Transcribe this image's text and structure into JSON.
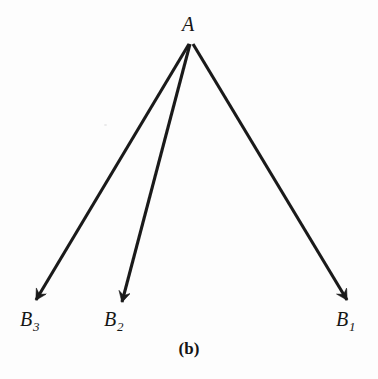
{
  "figure": {
    "caption": "(b)",
    "background_color": "#fdfdfd",
    "stroke_color": "#1a1a1a",
    "label_color": "#161616",
    "width": 378,
    "height": 379
  },
  "nodes": [
    {
      "id": "A",
      "label": "A",
      "subscript": "",
      "x": 191,
      "y": 42,
      "label_x": 190,
      "label_y": 28
    },
    {
      "id": "B1",
      "label": "B",
      "subscript": "1",
      "x": 349,
      "y": 302,
      "label_x": 350,
      "label_y": 323
    },
    {
      "id": "B2",
      "label": "B",
      "subscript": "2",
      "x": 120,
      "y": 305,
      "label_x": 118,
      "label_y": 323
    },
    {
      "id": "B3",
      "label": "B",
      "subscript": "3",
      "x": 33,
      "y": 303,
      "label_x": 32,
      "label_y": 323
    }
  ],
  "arrows": [
    {
      "id": "arrow-A-B1",
      "from": "A",
      "to": "B1",
      "x1": 193,
      "y1": 44,
      "x2": 347,
      "y2": 300
    },
    {
      "id": "arrow-A-B2",
      "from": "A",
      "to": "B2",
      "x1": 190,
      "y1": 44,
      "x2": 122,
      "y2": 302
    },
    {
      "id": "arrow-A-B3",
      "from": "A",
      "to": "B3",
      "x1": 189,
      "y1": 44,
      "x2": 36,
      "y2": 300
    }
  ],
  "chart_data": {
    "type": "diagram",
    "title": "(b)",
    "nodes": [
      "A",
      "B3",
      "B2",
      "B1"
    ],
    "edges": [
      {
        "source": "A",
        "target": "B1",
        "directed": true
      },
      {
        "source": "A",
        "target": "B2",
        "directed": true
      },
      {
        "source": "A",
        "target": "B3",
        "directed": true
      }
    ]
  }
}
